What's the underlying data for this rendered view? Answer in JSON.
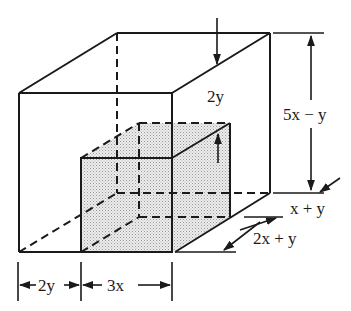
{
  "diagram": {
    "type": "dimensioned-box-with-cutout",
    "colors": {
      "line": "#1a1a1a",
      "shade": "#d9d9d9",
      "background": "#ffffff"
    },
    "labels": {
      "inner_top_gap": "2y",
      "height": "5x − y",
      "depth_back": "x + y",
      "depth_front": "2x + y",
      "width_left": "2y",
      "width_cutout": "3x"
    }
  }
}
